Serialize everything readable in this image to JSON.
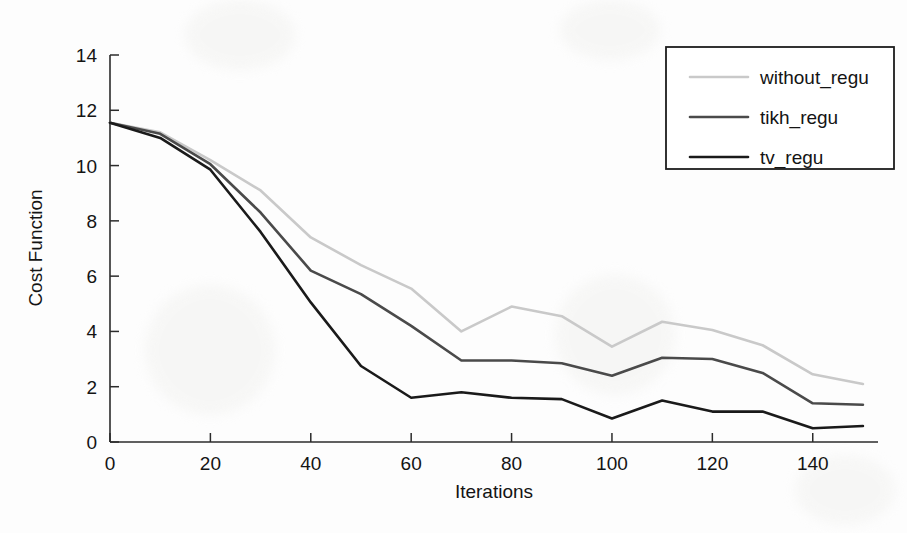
{
  "chart_data": {
    "type": "line",
    "title": "",
    "xlabel": "Iterations",
    "ylabel": "Cost Function",
    "xlim": [
      0,
      153
    ],
    "ylim": [
      0,
      14
    ],
    "xticks": [
      0,
      20,
      40,
      60,
      80,
      100,
      120,
      140
    ],
    "yticks": [
      0,
      2,
      4,
      6,
      8,
      10,
      12,
      14
    ],
    "xtick_labels": [
      "0",
      "20",
      "40",
      "60",
      "80",
      "100",
      "120",
      "140"
    ],
    "ytick_labels": [
      "0",
      "2",
      "4",
      "6",
      "8",
      "10",
      "12",
      "14"
    ],
    "grid": false,
    "legend_position": "top-right",
    "x": [
      0,
      10,
      20,
      30,
      40,
      50,
      60,
      70,
      80,
      90,
      100,
      110,
      120,
      130,
      140,
      150
    ],
    "series": [
      {
        "name": "without_regu",
        "color": "#c9c9c9",
        "width": 2.6,
        "values": [
          11.55,
          11.2,
          10.2,
          9.1,
          7.4,
          6.4,
          5.55,
          4.0,
          4.9,
          4.55,
          3.45,
          4.35,
          4.05,
          3.5,
          2.45,
          2.1
        ]
      },
      {
        "name": "tikh_regu",
        "color": "#4a4a4a",
        "width": 2.6,
        "values": [
          11.55,
          11.15,
          10.05,
          8.3,
          6.2,
          5.35,
          4.2,
          2.95,
          2.95,
          2.85,
          2.4,
          3.05,
          3.0,
          2.5,
          1.4,
          1.35
        ]
      },
      {
        "name": "tv_regu",
        "color": "#1a1a1a",
        "width": 2.6,
        "values": [
          11.55,
          11.0,
          9.85,
          7.6,
          5.05,
          2.75,
          1.6,
          1.8,
          1.6,
          1.55,
          0.85,
          1.5,
          1.1,
          1.1,
          0.5,
          0.58
        ]
      }
    ]
  },
  "legend": {
    "entries": [
      {
        "label": "without_regu"
      },
      {
        "label": "tikh_regu"
      },
      {
        "label": "tv_regu"
      }
    ]
  }
}
